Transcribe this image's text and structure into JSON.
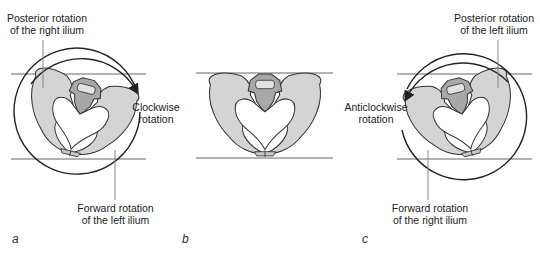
{
  "figure": {
    "panels": [
      {
        "id": "a",
        "letter": "a",
        "top_label_line1": "Posterior rotation",
        "top_label_line2": "of the right ilium",
        "side_label_line1": "Clockwise",
        "side_label_line2": "rotation",
        "bottom_label_line1": "Forward rotation",
        "bottom_label_line2": "of the left ilium"
      },
      {
        "id": "b",
        "letter": "b"
      },
      {
        "id": "c",
        "letter": "c",
        "top_label_line1": "Posterior rotation",
        "top_label_line2": "of the left ilium",
        "side_label_line1": "Anticlockwise",
        "side_label_line2": "rotation",
        "bottom_label_line1": "Forward rotation",
        "bottom_label_line2": "of the right ilium"
      }
    ],
    "colors": {
      "bone_fill": "#d4d4d4",
      "sacrum_fill": "#a8a8a8",
      "outline": "#333333",
      "leader_line": "#888888",
      "reference_line": "#555555"
    }
  }
}
